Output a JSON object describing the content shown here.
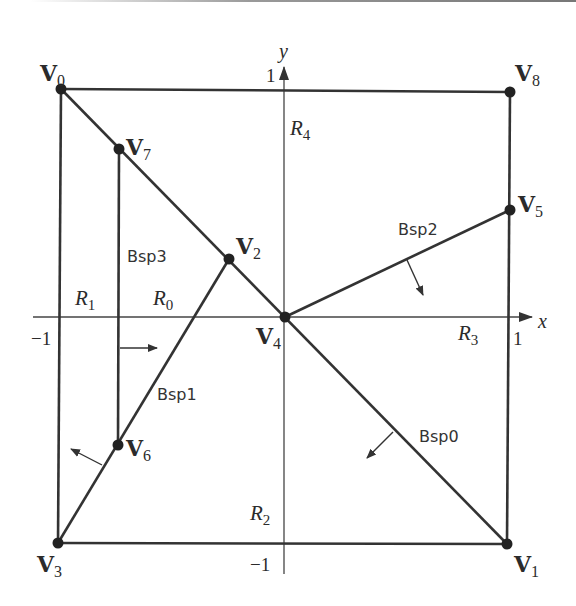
{
  "diagram": {
    "type": "bsp-tree-partition",
    "colors": {
      "stroke": "#333333",
      "axis": "#444444",
      "text": "#2b2b2b",
      "background": "#ffffff"
    },
    "axes": {
      "x_label": "x",
      "y_label": "y",
      "ticks": {
        "x_neg": "−1",
        "x_pos": "1",
        "y_pos": "1",
        "y_neg": "−1"
      }
    },
    "vertices": [
      {
        "id": "V0",
        "letter": "V",
        "sub": "0"
      },
      {
        "id": "V1",
        "letter": "V",
        "sub": "1"
      },
      {
        "id": "V2",
        "letter": "V",
        "sub": "2"
      },
      {
        "id": "V3",
        "letter": "V",
        "sub": "3"
      },
      {
        "id": "V4",
        "letter": "V",
        "sub": "4"
      },
      {
        "id": "V5",
        "letter": "V",
        "sub": "5"
      },
      {
        "id": "V6",
        "letter": "V",
        "sub": "6"
      },
      {
        "id": "V7",
        "letter": "V",
        "sub": "7"
      },
      {
        "id": "V8",
        "letter": "V",
        "sub": "8"
      }
    ],
    "regions": [
      {
        "id": "R0",
        "letter": "R",
        "sub": "0"
      },
      {
        "id": "R1",
        "letter": "R",
        "sub": "1"
      },
      {
        "id": "R2",
        "letter": "R",
        "sub": "2"
      },
      {
        "id": "R3",
        "letter": "R",
        "sub": "3"
      },
      {
        "id": "R4",
        "letter": "R",
        "sub": "4"
      }
    ],
    "splitters": [
      {
        "id": "Bsp0",
        "label": "Bsp0",
        "from": "V1",
        "to": "V0"
      },
      {
        "id": "Bsp1",
        "label": "Bsp1",
        "from": "V3",
        "to": "V2"
      },
      {
        "id": "Bsp2",
        "label": "Bsp2",
        "from": "V4",
        "to": "V5"
      },
      {
        "id": "Bsp3",
        "label": "Bsp3",
        "from": "V6",
        "to": "V7"
      }
    ]
  }
}
